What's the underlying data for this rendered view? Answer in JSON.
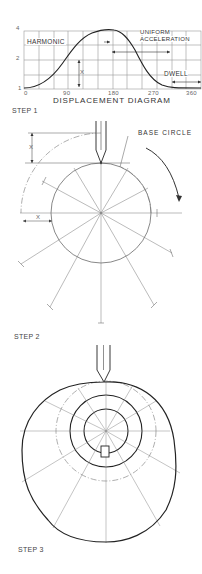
{
  "displacement_diagram": {
    "title": "DISPLACEMENT DIAGRAM",
    "y_ticks": [
      "1",
      "2",
      "4"
    ],
    "x_ticks": [
      "0",
      "90",
      "180",
      "270",
      "360"
    ],
    "labels": {
      "harmonic": "HARMONIC",
      "uniform_line1": "UNIFORM",
      "uniform_line2": "ACCELERATION",
      "dwell": "DWELL",
      "x_marker": "X"
    }
  },
  "step1": {
    "label": "STEP 1",
    "base_circle_label": "BASE CIRCLE",
    "x_marker_top": "X",
    "x_marker_left": "X"
  },
  "step2": {
    "label": "STEP 2"
  },
  "step3": {
    "label": "STEP 3"
  },
  "colors": {
    "line": "#222222",
    "thin": "#777777",
    "grid": "#999999"
  }
}
